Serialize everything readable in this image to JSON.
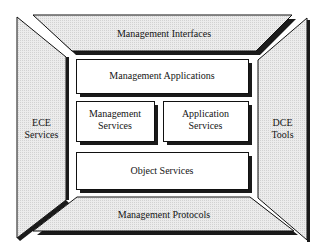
{
  "diagram": {
    "colors": {
      "background": "#ffffff",
      "panel_fill": "#e6e6e6",
      "box_fill": "#ffffff",
      "stroke": "#111111",
      "shadow": "#1a1a1a"
    },
    "outer_panels": {
      "top": {
        "label": "Management Interfaces"
      },
      "bottom": {
        "label": "Management Protocols"
      },
      "left": {
        "line1": "ECE",
        "line2": "Services"
      },
      "right": {
        "line1": "DCE",
        "line2": "Tools"
      }
    },
    "inner_boxes": {
      "management_applications": {
        "label": "Management Applications"
      },
      "management_services": {
        "line1": "Management",
        "line2": "Services"
      },
      "application_services": {
        "line1": "Application",
        "line2": "Services"
      },
      "object_services": {
        "label": "Object Services"
      }
    }
  }
}
